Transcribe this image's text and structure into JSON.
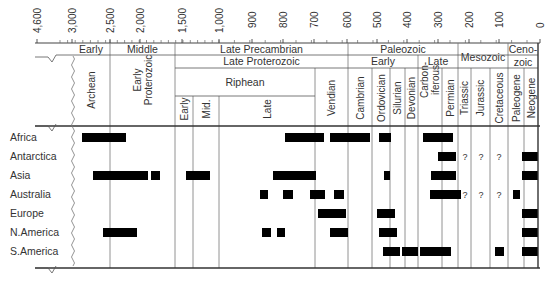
{
  "chart_data": {
    "type": "timeline-range",
    "title": "",
    "axis": {
      "label": "Age (Ma)",
      "ticks": [
        {
          "label": "4,600",
          "x": 37
        },
        {
          "label": "3,000",
          "x": 72
        },
        {
          "label": "2,500",
          "x": 110
        },
        {
          "label": "2,000",
          "x": 140
        },
        {
          "label": "1,500",
          "x": 182
        },
        {
          "label": "1,000",
          "x": 219
        },
        {
          "label": "900",
          "x": 252
        },
        {
          "label": "800",
          "x": 283
        },
        {
          "label": "700",
          "x": 314
        },
        {
          "label": "600",
          "x": 347
        },
        {
          "label": "500",
          "x": 377
        },
        {
          "label": "400",
          "x": 407
        },
        {
          "label": "300",
          "x": 438
        },
        {
          "label": "200",
          "x": 469
        },
        {
          "label": "100",
          "x": 499
        },
        {
          "label": "0",
          "x": 540
        }
      ]
    },
    "header": {
      "eons_row1": [
        {
          "label": "Early",
          "x1": 72,
          "x2": 110
        },
        {
          "label": "Middle",
          "x1": 110,
          "x2": 175
        },
        {
          "label": "Late Precambrian",
          "x1": 175,
          "x2": 348
        },
        {
          "label": "Paleozoic",
          "x1": 348,
          "x2": 458
        },
        {
          "label": "Mesozoic",
          "x1": 458,
          "x2": 508
        },
        {
          "label": "Ceno-",
          "label2": "zoic",
          "x1": 508,
          "x2": 538
        }
      ],
      "row2": [
        {
          "label": "Late Proterozoic",
          "x1": 175,
          "x2": 348
        },
        {
          "label": "Early",
          "x1": 348,
          "x2": 418
        },
        {
          "label": "Late",
          "x1": 418,
          "x2": 458
        }
      ],
      "row3": [
        {
          "label": "Riphean",
          "x1": 175,
          "x2": 315
        }
      ],
      "vertical_labels": [
        {
          "label": "Archean",
          "x1": 72,
          "x2": 110,
          "top": 58
        },
        {
          "label": "Early",
          "label2": "Proterozoic",
          "x1": 110,
          "x2": 175,
          "top": 58
        },
        {
          "label": "Early",
          "x1": 175,
          "x2": 193,
          "top": 96
        },
        {
          "label": "Mid.",
          "x1": 193,
          "x2": 219,
          "top": 96
        },
        {
          "label": "Late",
          "x1": 219,
          "x2": 315,
          "top": 96
        },
        {
          "label": "Vendian",
          "x1": 315,
          "x2": 348,
          "top": 74
        },
        {
          "label": "Cambrian",
          "x1": 348,
          "x2": 372,
          "top": 74
        },
        {
          "label": "Ordovician",
          "x1": 372,
          "x2": 390,
          "top": 74
        },
        {
          "label": "Silurian",
          "x1": 390,
          "x2": 405,
          "top": 74
        },
        {
          "label": "Devonian",
          "x1": 405,
          "x2": 418,
          "top": 74
        },
        {
          "label": "Carbon-",
          "label2": "iferous",
          "x1": 418,
          "x2": 442,
          "top": 74
        },
        {
          "label": "Permian",
          "x1": 442,
          "x2": 458,
          "top": 74
        },
        {
          "label": "Triassic",
          "x1": 458,
          "x2": 471,
          "top": 74
        },
        {
          "label": "Jurassic",
          "x1": 471,
          "x2": 490,
          "top": 74
        },
        {
          "label": "Cretaceous",
          "x1": 490,
          "x2": 508,
          "top": 74
        },
        {
          "label": "Paleogene",
          "x1": 508,
          "x2": 524,
          "top": 74
        },
        {
          "label": "Neogene",
          "x1": 524,
          "x2": 538,
          "top": 74
        }
      ]
    },
    "rows": [
      {
        "name": "Africa",
        "y": 137,
        "bars": [
          [
            82,
            126
          ],
          [
            285,
            324
          ],
          [
            330,
            370
          ],
          [
            379,
            391
          ],
          [
            423,
            453
          ]
        ],
        "unknown": []
      },
      {
        "name": "Antarctica",
        "y": 156,
        "bars": [
          [
            438,
            456
          ],
          [
            522,
            538
          ]
        ],
        "unknown": [
          465,
          481,
          499
        ]
      },
      {
        "name": "Asia",
        "y": 175,
        "bars": [
          [
            93,
            148
          ],
          [
            151,
            160
          ],
          [
            186,
            210
          ],
          [
            273,
            316
          ],
          [
            384,
            390
          ],
          [
            431,
            456
          ],
          [
            522,
            538
          ]
        ],
        "unknown": []
      },
      {
        "name": "Australia",
        "y": 194,
        "bars": [
          [
            260,
            268
          ],
          [
            283,
            293
          ],
          [
            310,
            325
          ],
          [
            334,
            344
          ],
          [
            430,
            461
          ],
          [
            513,
            520
          ]
        ],
        "unknown": [
          465,
          481,
          499
        ]
      },
      {
        "name": "Europe",
        "y": 213,
        "bars": [
          [
            318,
            346
          ],
          [
            377,
            395
          ],
          [
            522,
            538
          ]
        ],
        "unknown": []
      },
      {
        "name": "N.America",
        "y": 232,
        "bars": [
          [
            103,
            137
          ],
          [
            262,
            271
          ],
          [
            277,
            285
          ],
          [
            330,
            348
          ],
          [
            379,
            397
          ],
          [
            522,
            538
          ]
        ],
        "unknown": []
      },
      {
        "name": "S.America",
        "y": 251,
        "bars": [
          [
            383,
            400
          ],
          [
            402,
            418
          ],
          [
            420,
            451
          ],
          [
            495,
            504
          ],
          [
            522,
            538
          ]
        ],
        "unknown": []
      }
    ],
    "unknown_marker": "?",
    "grid": true,
    "legend": null
  }
}
